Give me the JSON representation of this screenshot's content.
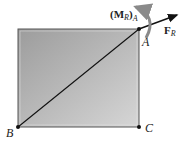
{
  "diagram": {
    "type": "rigid plate with resultant force and couple moment",
    "points": {
      "A": {
        "label": "A"
      },
      "B": {
        "label": "B"
      },
      "C": {
        "label": "C"
      }
    },
    "force": {
      "symbol": "F",
      "subscript": "R"
    },
    "moment": {
      "open": "(",
      "symbol": "M",
      "subscript": "R",
      "close": ")",
      "sub_point": "A"
    },
    "colors": {
      "plate_dark": "#9a9a9a",
      "plate_light": "#d4d4d4",
      "moment_arrow": "#8a8a8a",
      "line": "#111111"
    }
  }
}
